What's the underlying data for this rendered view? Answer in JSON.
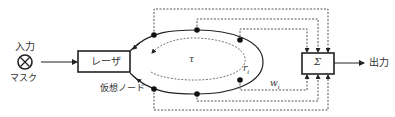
{
  "diagram": {
    "input": {
      "label": "入力",
      "mask_label": "マスク",
      "symbol": "⊗"
    },
    "laser": {
      "label": "レーザ"
    },
    "virtual_node_label": "仮想ノード",
    "loop": {
      "delay_label": "τ",
      "node_label": "r",
      "node_sub": "i"
    },
    "weight": {
      "label": "w",
      "sub": "i"
    },
    "sum": {
      "label": "Σ"
    },
    "output": {
      "label": "出力"
    },
    "colors": {
      "line": "#222222",
      "dotted": "#555555",
      "text": "#333333"
    }
  }
}
